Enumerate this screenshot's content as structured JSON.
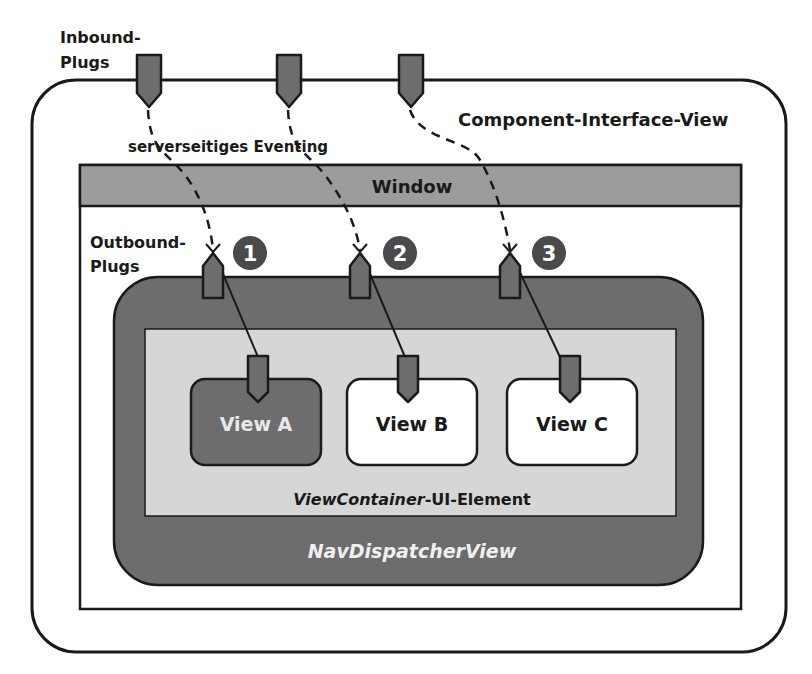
{
  "labels": {
    "inbound_line1": "Inbound-",
    "inbound_line2": "Plugs",
    "component_interface_view": "Component-Interface-View",
    "server_eventing": "serverseitiges Eventing",
    "window": "Window",
    "outbound_line1": "Outbound-",
    "outbound_line2": "Plugs",
    "view_container_italic": "ViewContainer",
    "view_container_rest": "-UI-Element",
    "nav_dispatcher_view": "NavDispatcherView"
  },
  "markers": [
    "1",
    "2",
    "3"
  ],
  "views": [
    {
      "label": "View A",
      "active": true
    },
    {
      "label": "View B",
      "active": false
    },
    {
      "label": "View C",
      "active": false
    }
  ],
  "colors": {
    "dark_gray": "#6d6d6d",
    "window_bar": "#9c9c9c",
    "light_gray": "#d6d6d6",
    "marker": "#4a4a4a",
    "stroke": "#1a1a1a"
  }
}
